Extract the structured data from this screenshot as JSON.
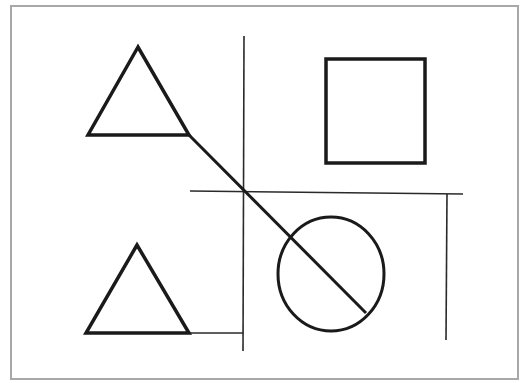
{
  "diagram": {
    "canvas": {
      "width": 527,
      "height": 383,
      "background": "#ffffff"
    },
    "frame": {
      "x": 11,
      "y": 6,
      "width": 507,
      "height": 373,
      "stroke": "#a8a8a8"
    },
    "colors": {
      "shape_stroke": "#1a1a1a",
      "line_stroke": "#2a2a2a"
    },
    "shapes": [
      {
        "id": "triangle-top",
        "type": "triangle",
        "points": "138,47 88,135 189,135"
      },
      {
        "id": "square",
        "type": "rect",
        "x": 326,
        "y": 59,
        "width": 99,
        "height": 104
      },
      {
        "id": "triangle-bottom",
        "type": "triangle",
        "points": "137,245 86,333 189,333"
      },
      {
        "id": "circle",
        "type": "ellipse",
        "cx": 331,
        "cy": 274,
        "rx": 53,
        "ry": 57
      }
    ],
    "lines": [
      {
        "id": "vertical-divider-left",
        "x1": 244,
        "y1": 36,
        "x2": 243,
        "y2": 351
      },
      {
        "id": "horizontal-divider",
        "x1": 190,
        "y1": 191,
        "x2": 463,
        "y2": 194
      },
      {
        "id": "vertical-divider-right",
        "x1": 447,
        "y1": 194,
        "x2": 446,
        "y2": 340
      },
      {
        "id": "connector-bottom",
        "x1": 189,
        "y1": 333,
        "x2": 243,
        "y2": 333
      },
      {
        "id": "diagonal-line",
        "x1": 189,
        "y1": 135,
        "x2": 366,
        "y2": 313
      }
    ]
  }
}
